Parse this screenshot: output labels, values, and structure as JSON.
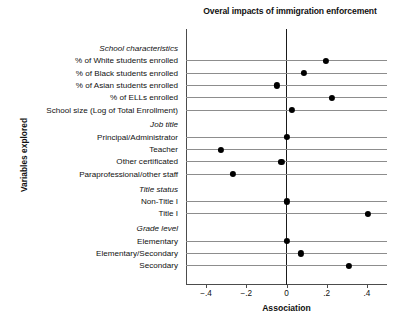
{
  "chart_data": {
    "type": "scatter",
    "title": "Overal impacts of immigration enforcement",
    "xlabel": "Association",
    "ylabel": "Variables explored",
    "xlim": [
      -0.5,
      0.5
    ],
    "xticks": [
      -0.4,
      -0.2,
      0,
      0.2,
      0.4
    ],
    "xticklabels": [
      "-.4",
      "-.2",
      "0",
      ".2",
      ".4"
    ],
    "grid": "horizontal",
    "legend": "none",
    "zero_reference_line": 0,
    "groups": [
      {
        "name": "School characteristics",
        "items": [
          {
            "label": "% of White students enrolled",
            "value": 0.195
          },
          {
            "label": "% of Black students enrolled",
            "value": 0.085
          },
          {
            "label": "% of Asian students enrolled",
            "value": -0.048
          },
          {
            "label": "% of ELLs enrolled",
            "value": 0.225
          },
          {
            "label": "School size (Log of Total Enrollment)",
            "value": 0.025
          }
        ]
      },
      {
        "name": "Job title",
        "items": [
          {
            "label": "Principal/Administrator",
            "value": 0.0
          },
          {
            "label": "Teacher",
            "value": -0.325
          },
          {
            "label": "Other certificated",
            "value": -0.025
          },
          {
            "label": "Paraprofessional/other staff",
            "value": -0.268
          }
        ]
      },
      {
        "name": "Title status",
        "items": [
          {
            "label": "Non-Title I",
            "value": 0.0
          },
          {
            "label": "Title I",
            "value": 0.405
          }
        ]
      },
      {
        "name": "Grade level",
        "items": [
          {
            "label": "Elementary",
            "value": 0.0
          },
          {
            "label": "Elementary/Secondary",
            "value": 0.072
          },
          {
            "label": "Secondary",
            "value": 0.31
          }
        ]
      }
    ],
    "colors": {
      "marker": "#000000",
      "gridline": "#8d8d8d",
      "axis": "#4c4c4c",
      "zero_line": "#1a1a1a",
      "text": "#111111",
      "background": "#ffffff"
    }
  }
}
